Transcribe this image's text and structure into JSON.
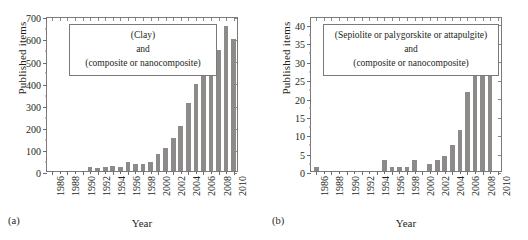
{
  "figure": {
    "panels": [
      {
        "id": "a",
        "sublabel": "(a)",
        "annotation": [
          "(Clay)",
          "and",
          "(composite or nanocomposite)"
        ],
        "chart_data": {
          "type": "bar",
          "title": "",
          "xlabel": "Year",
          "ylabel": "Published items",
          "xlim": [
            1985.3,
            2010.7
          ],
          "ylim": [
            0,
            700
          ],
          "ytick_values": [
            0,
            100,
            200,
            300,
            400,
            500,
            600,
            700
          ],
          "ytick_labels": [
            "0",
            "100",
            "200",
            "300",
            "400",
            "500",
            "600",
            "700"
          ],
          "xtick_labels": [
            "1986",
            "1988",
            "1990",
            "1992",
            "1994",
            "1996",
            "1998",
            "2000",
            "2002",
            "2004",
            "2006",
            "2008",
            "2010"
          ],
          "grid": false,
          "legend": "none",
          "bar_color": "#8d8b8a",
          "categories": [
            1986,
            1987,
            1988,
            1989,
            1990,
            1991,
            1992,
            1993,
            1994,
            1995,
            1996,
            1997,
            1998,
            1999,
            2000,
            2001,
            2002,
            2003,
            2004,
            2005,
            2006,
            2007,
            2008,
            2009,
            2010
          ],
          "values": [
            0,
            0,
            0,
            0,
            0,
            18,
            13,
            18,
            23,
            20,
            42,
            33,
            31,
            40,
            78,
            105,
            147,
            203,
            305,
            393,
            482,
            538,
            545,
            657,
            595
          ]
        }
      },
      {
        "id": "b",
        "sublabel": "(b)",
        "annotation": [
          "(Sepiolite or palygorskite or attapulgite)",
          "and",
          "(composite or nanocomposite)"
        ],
        "chart_data": {
          "type": "bar",
          "title": "",
          "xlabel": "Year",
          "ylabel": "Published items",
          "xlim": [
            1985.3,
            2010.7
          ],
          "ylim": [
            0,
            42
          ],
          "ytick_values": [
            0,
            5,
            10,
            15,
            20,
            25,
            30,
            35,
            40
          ],
          "ytick_labels": [
            "0",
            "5",
            "10",
            "15",
            "20",
            "25",
            "30",
            "35",
            "40"
          ],
          "xtick_labels": [
            "1986",
            "1988",
            "1990",
            "1992",
            "1994",
            "1996",
            "1998",
            "2000",
            "2002",
            "2004",
            "2006",
            "2008",
            "2010"
          ],
          "grid": false,
          "legend": "none",
          "bar_color": "#8d8b8a",
          "categories": [
            1986,
            1987,
            1988,
            1989,
            1990,
            1991,
            1992,
            1993,
            1994,
            1995,
            1996,
            1997,
            1998,
            1999,
            2000,
            2001,
            2002,
            2003,
            2004,
            2005,
            2006,
            2007,
            2008,
            2009,
            2010
          ],
          "values": [
            1,
            0,
            0,
            0,
            0,
            0,
            0,
            0,
            0,
            3,
            1,
            1,
            1,
            3,
            0,
            2,
            3,
            4,
            7,
            11,
            21.5,
            26.5,
            29.5,
            38.5,
            0
          ]
        }
      }
    ]
  }
}
